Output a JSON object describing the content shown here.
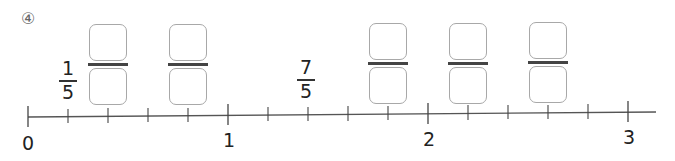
{
  "problem": {
    "number_label": "④"
  },
  "given_fractions": [
    {
      "numerator": "1",
      "denominator": "5",
      "position": 1
    },
    {
      "numerator": "7",
      "denominator": "5",
      "position": 7
    }
  ],
  "answer_blanks": [
    {
      "position": 2,
      "numerator": "",
      "denominator": ""
    },
    {
      "position": 4,
      "numerator": "",
      "denominator": ""
    },
    {
      "position": 9,
      "numerator": "",
      "denominator": ""
    },
    {
      "position": 11,
      "numerator": "",
      "denominator": ""
    },
    {
      "position": 13,
      "numerator": "",
      "denominator": ""
    }
  ],
  "number_line": {
    "min": 0,
    "max": 3,
    "subdivisions_per_unit": 5,
    "labels": [
      "0",
      "1",
      "2",
      "3"
    ],
    "line_color": "#555555",
    "tick_color": "#444444"
  }
}
